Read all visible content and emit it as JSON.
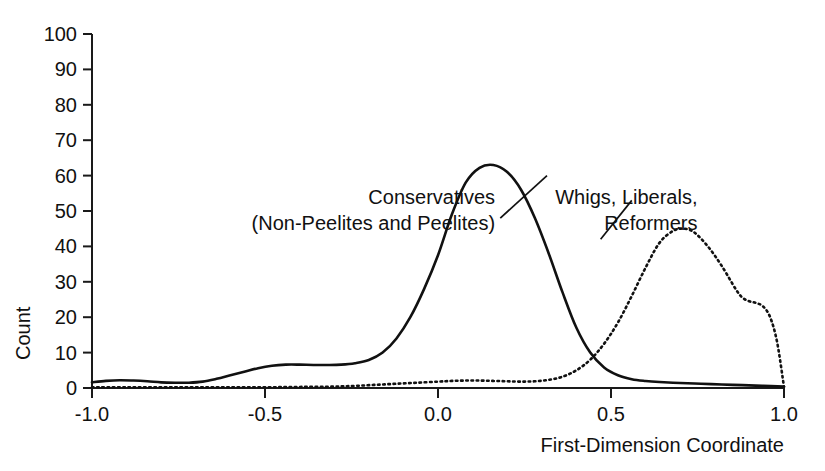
{
  "chart_data": {
    "type": "line",
    "title": "",
    "subtitle": "",
    "xlabel": "First-Dimension Coordinate",
    "ylabel": "Count",
    "xlim": [
      -1.0,
      1.0
    ],
    "ylim": [
      0,
      100
    ],
    "grid": false,
    "legend_position": "none",
    "xticks": [
      -1.0,
      -0.5,
      0.0,
      0.5,
      1.0
    ],
    "xtick_labels": [
      "-1.0",
      "-0.5",
      "0.0",
      "0.5",
      "1.0"
    ],
    "yticks": [
      0,
      10,
      20,
      30,
      40,
      50,
      60,
      70,
      80,
      90,
      100
    ],
    "ytick_labels": [
      "0",
      "10",
      "20",
      "30",
      "40",
      "50",
      "60",
      "70",
      "80",
      "90",
      "100"
    ],
    "series": [
      {
        "name": "Conservatives (Non-Peelites and Peelites)",
        "style": "solid",
        "color": "#111111",
        "peak_x": 0.16,
        "peak_y": 63,
        "x": [
          -1.0,
          -0.96,
          -0.92,
          -0.88,
          -0.84,
          -0.8,
          -0.76,
          -0.72,
          -0.68,
          -0.64,
          -0.6,
          -0.56,
          -0.52,
          -0.48,
          -0.44,
          -0.4,
          -0.36,
          -0.32,
          -0.28,
          -0.24,
          -0.2,
          -0.16,
          -0.12,
          -0.08,
          -0.04,
          0.0,
          0.04,
          0.08,
          0.12,
          0.16,
          0.2,
          0.24,
          0.28,
          0.32,
          0.36,
          0.4,
          0.44,
          0.48,
          0.52,
          0.56,
          0.6,
          0.64,
          0.7,
          0.76,
          0.82,
          0.88,
          0.94,
          1.0
        ],
        "y": [
          1.6,
          2.0,
          2.2,
          2.1,
          1.9,
          1.6,
          1.5,
          1.5,
          1.8,
          2.6,
          3.6,
          4.6,
          5.6,
          6.3,
          6.6,
          6.6,
          6.5,
          6.5,
          6.6,
          7.0,
          7.9,
          10.0,
          14.0,
          20.0,
          28.0,
          37.5,
          49.0,
          58.0,
          62.2,
          63.0,
          61.0,
          56.0,
          48.0,
          38.0,
          27.0,
          17.0,
          10.0,
          5.8,
          3.6,
          2.5,
          2.0,
          1.7,
          1.4,
          1.2,
          1.0,
          0.8,
          0.6,
          0.4
        ]
      },
      {
        "name": "Whigs, Liberals, Reformers",
        "style": "dotted",
        "color": "#111111",
        "peak_x": 0.71,
        "peak_y": 45,
        "x": [
          -1.0,
          -0.9,
          -0.8,
          -0.7,
          -0.6,
          -0.5,
          -0.4,
          -0.3,
          -0.24,
          -0.18,
          -0.12,
          -0.06,
          0.0,
          0.04,
          0.08,
          0.12,
          0.16,
          0.2,
          0.24,
          0.28,
          0.32,
          0.36,
          0.4,
          0.44,
          0.48,
          0.52,
          0.56,
          0.6,
          0.64,
          0.68,
          0.71,
          0.74,
          0.78,
          0.82,
          0.86,
          0.88,
          0.9,
          0.92,
          0.94,
          0.96,
          0.98,
          1.0
        ],
        "y": [
          0.2,
          0.2,
          0.2,
          0.2,
          0.2,
          0.2,
          0.3,
          0.4,
          0.6,
          0.9,
          1.2,
          1.5,
          1.8,
          2.0,
          2.1,
          2.1,
          2.0,
          1.9,
          1.8,
          1.9,
          2.3,
          3.2,
          5.0,
          8.0,
          12.5,
          18.5,
          26.0,
          34.0,
          41.0,
          44.4,
          45.0,
          44.0,
          40.0,
          34.5,
          28.0,
          25.5,
          24.5,
          24.0,
          23.0,
          20.0,
          13.0,
          0.3
        ]
      }
    ],
    "annotations": [
      {
        "id": "conservatives",
        "lines": [
          "Conservatives",
          "(Non-Peelites and Peelites)"
        ],
        "anchor": "end",
        "text_x": 0.165,
        "text_y": 52,
        "leader_from_x": 0.18,
        "leader_from_y": 48,
        "leader_to_x": 0.315,
        "leader_to_y": 60
      },
      {
        "id": "whigs",
        "lines": [
          "Whigs, Liberals,",
          "Reformers"
        ],
        "anchor": "end",
        "text_x": 0.75,
        "text_y": 52,
        "leader_from_x": 0.56,
        "leader_from_y": 53,
        "leader_to_x": 0.47,
        "leader_to_y": 42
      }
    ]
  }
}
